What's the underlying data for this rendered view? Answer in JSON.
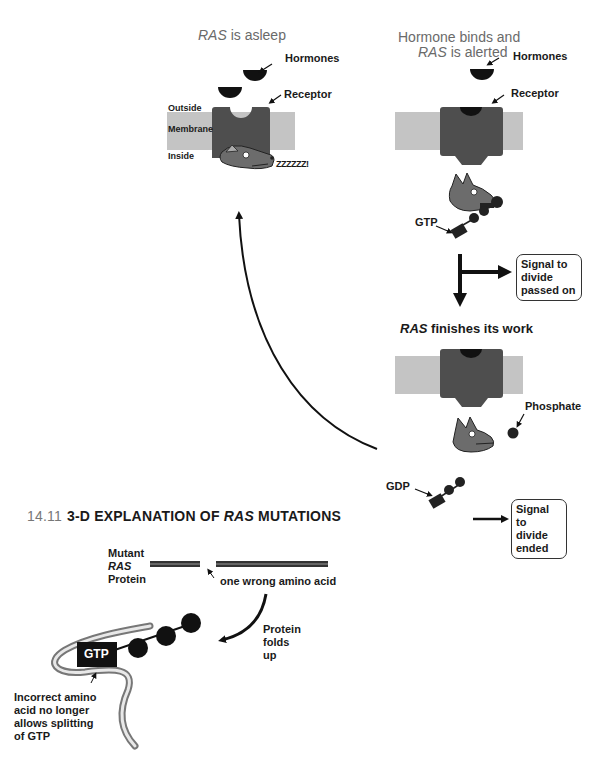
{
  "panels": {
    "asleep": {
      "title_italic": "RAS",
      "title_rest": " is asleep",
      "hormones_label": "Hormones",
      "receptor_label": "Receptor",
      "outside_label": "Outside",
      "membrane_label": "Membrane",
      "inside_label": "Inside",
      "snore_text": "ZZZZZZ!"
    },
    "alerted": {
      "title_line1": "Hormone binds and",
      "title_italic": "RAS",
      "title_rest": " is alerted",
      "hormones_label": "Hormones",
      "receptor_label": "Receptor",
      "gtp_label": "GTP",
      "signal_box": "Signal to\ndivide\npassed on"
    },
    "finishes": {
      "title_italic": "RAS",
      "title_rest": " finishes its work",
      "phosphate_label": "Phosphate",
      "gdp_label": "GDP",
      "signal_box": "Signal to\ndivide\nended"
    }
  },
  "figure": {
    "number": "14.11",
    "title_pre": "3-D EXPLANATION OF ",
    "title_italic": "RAS",
    "title_post": " MUTATIONS",
    "protein_label_line1": "Mutant",
    "protein_label_line2": "RAS",
    "protein_label_line3": "Protein",
    "wrong_amino_label": "one wrong amino acid",
    "folds_label": "Protein\nfolds\nup",
    "gtp_label": "GTP",
    "incorrect_label": "Incorrect amino\nacid no longer\nallows splitting\nof GTP"
  },
  "colors": {
    "receptor": "#4e4e4e",
    "membrane": "#c4c4c4",
    "hormone": "#111111",
    "ras_head": "#6c6c6c",
    "title_gray": "#6a6a6a"
  }
}
